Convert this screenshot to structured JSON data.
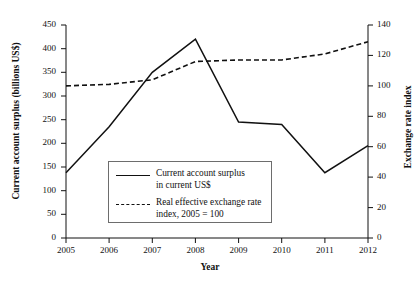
{
  "chart_data": {
    "type": "line",
    "title": "",
    "xlabel": "Year",
    "categories": [
      "2005",
      "2006",
      "2007",
      "2008",
      "2009",
      "2010",
      "2011",
      "2012"
    ],
    "x": [
      2005,
      2006,
      2007,
      2008,
      2009,
      2010,
      2011,
      2012
    ],
    "grid": false,
    "legend_position": "inside-bottom-left",
    "axes": {
      "left": {
        "label": "Current account surplus (billions US$)",
        "ylim": [
          0,
          450
        ],
        "ticks": [
          0,
          50,
          100,
          150,
          200,
          250,
          300,
          350,
          400,
          450
        ],
        "tick_labels": [
          "0",
          "50",
          "100",
          "150",
          "200",
          "250",
          "300",
          "350",
          "400",
          "450"
        ]
      },
      "right": {
        "label": "Exchange rate index",
        "ylim": [
          0,
          140
        ],
        "ticks": [
          0,
          20,
          40,
          60,
          80,
          100,
          120,
          140
        ],
        "tick_labels": [
          "0",
          "20",
          "40",
          "60",
          "80",
          "100",
          "120",
          "140"
        ]
      },
      "x": {
        "label": "Year",
        "ticks": [
          2005,
          2006,
          2007,
          2008,
          2009,
          2010,
          2011,
          2012
        ]
      }
    },
    "series": [
      {
        "name": "Current account surplus in current US$",
        "legend_label_line1": "Current account surplus",
        "legend_label_line2": "in current US$",
        "style": "solid",
        "color": "#111111",
        "axis": "left",
        "values": [
          138,
          235,
          350,
          420,
          245,
          240,
          138,
          195
        ]
      },
      {
        "name": "Real effective exchange rate index, 2005 = 100",
        "legend_label_line1": "Real effective exchange rate",
        "legend_label_line2": "index, 2005 = 100",
        "style": "dashed",
        "color": "#111111",
        "axis": "right",
        "values": [
          100,
          101,
          104,
          116,
          117,
          117,
          121,
          129
        ]
      }
    ]
  }
}
